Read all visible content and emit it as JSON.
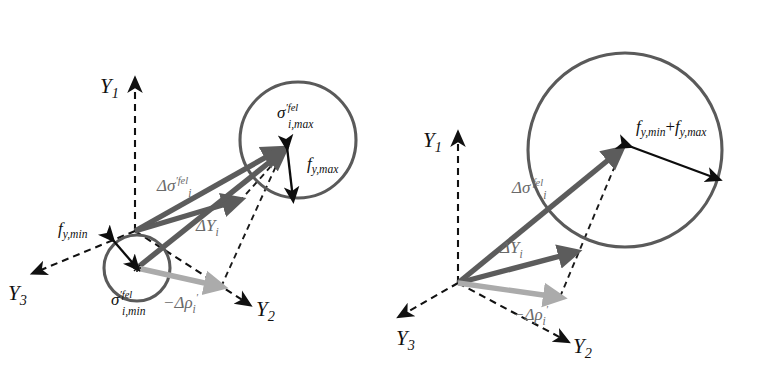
{
  "figure": {
    "background_color": "#ffffff",
    "colors": {
      "vector_dark": "#5c5c5c",
      "vector_light": "#ababab",
      "circle_stroke": "#5a5a5a",
      "axis": "#111111",
      "black_arrow": "#0d0d0d",
      "label_gray": "#6a6a6a"
    }
  },
  "panels": [
    {
      "id": "left-panel",
      "name": "two-circle-panel",
      "axes": [
        {
          "name": "Y1",
          "base": "Y",
          "sub": "1"
        },
        {
          "name": "Y2",
          "base": "Y",
          "sub": "2"
        },
        {
          "name": "Y3",
          "base": "Y",
          "sub": "3"
        }
      ],
      "labels": {
        "sigma_max": {
          "base": "σ",
          "prime": "′",
          "sup": "fel",
          "sub": "i,max"
        },
        "sigma_min": {
          "base": "σ",
          "prime": "′",
          "sup": "fel",
          "sub": "i,min"
        },
        "delta_sigma": {
          "base": "Δσ",
          "prime": "′",
          "sup": "fel",
          "sub": "i"
        },
        "delta_Y": {
          "base": "ΔY",
          "sub": "i"
        },
        "minus_delta_rho": {
          "base": "−Δρ",
          "prime": "′",
          "sub": "i"
        },
        "f_y_max": {
          "base": "f",
          "sub": "y,max"
        },
        "f_y_min": {
          "base": "f",
          "sub": "y,min"
        }
      },
      "circles": [
        {
          "name": "max-yield-circle",
          "cx": 298,
          "cy": 140,
          "r": 58
        },
        {
          "name": "min-yield-circle",
          "cx": 137,
          "cy": 268,
          "r": 33
        }
      ],
      "origin": {
        "x": 135,
        "y": 231
      }
    },
    {
      "id": "right-panel",
      "name": "single-circle-panel",
      "axes": [
        {
          "name": "Y1",
          "base": "Y",
          "sub": "1"
        },
        {
          "name": "Y2",
          "base": "Y",
          "sub": "2"
        },
        {
          "name": "Y3",
          "base": "Y",
          "sub": "3"
        }
      ],
      "labels": {
        "delta_sigma": {
          "base": "Δσ",
          "prime": "′",
          "sup": "fel",
          "sub": "i"
        },
        "delta_Y": {
          "base": "ΔY",
          "sub": "i"
        },
        "minus_delta_rho": {
          "base": "−Δρ",
          "prime": "′",
          "sub": "i"
        },
        "f_sum": {
          "first_base": "f",
          "first_sub": "y,min",
          "plus": "+",
          "second_base": "f",
          "second_sub": "y,max"
        }
      },
      "circles": [
        {
          "name": "combined-yield-circle",
          "cx": 625,
          "cy": 150,
          "r": 97
        }
      ],
      "origin": {
        "x": 458,
        "y": 283
      }
    }
  ]
}
